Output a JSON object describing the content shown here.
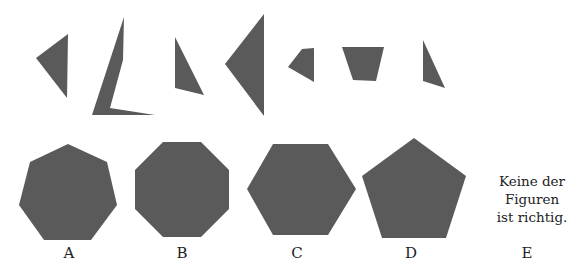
{
  "colors": {
    "shape_fill": "#5a5a5a",
    "text": "#222222",
    "background": "#ffffff"
  },
  "pieces": [
    {
      "name": "piece-1-triangle",
      "points": "36,58 68,34 67,98"
    },
    {
      "name": "piece-2-bent-sliver",
      "points": "124,17 123,60 110,108 155,115 92,115"
    },
    {
      "name": "piece-3-triangle",
      "points": "175,37 204,95 175,88"
    },
    {
      "name": "piece-4-triangle",
      "points": "264,14 264,116 225,64"
    },
    {
      "name": "piece-5-quad",
      "points": "288,67 302,49 314,48 314,82"
    },
    {
      "name": "piece-6-trapezoid",
      "points": "342,47 384,47 376,81 353,80"
    },
    {
      "name": "piece-7-triangle",
      "points": "423,40 445,88 423,81"
    }
  ],
  "options": [
    {
      "id": "A",
      "label": "A",
      "shape": "heptagon",
      "points": "68,144 107,162 117,205 91,240 44,240 19,205 30,162",
      "label_x": 69,
      "label_y": 244
    },
    {
      "id": "B",
      "label": "B",
      "shape": "octagon",
      "points": "163,142 201,142 229,170 229,209 201,237 163,237 135,209 135,170",
      "label_x": 182,
      "label_y": 244
    },
    {
      "id": "C",
      "label": "C",
      "shape": "hexagon",
      "points": "273,144 328,144 356,189 328,235 273,235 247,189",
      "label_x": 297,
      "label_y": 244
    },
    {
      "id": "D",
      "label": "D",
      "shape": "pentagon",
      "points": "414,138 466,176 446,238 382,238 362,176",
      "label_x": 411,
      "label_y": 244
    },
    {
      "id": "E",
      "label": "E",
      "shape": "none",
      "text_lines": [
        "Keine der",
        "Figuren",
        "ist richtig."
      ],
      "label_x": 527,
      "label_y": 244
    }
  ]
}
